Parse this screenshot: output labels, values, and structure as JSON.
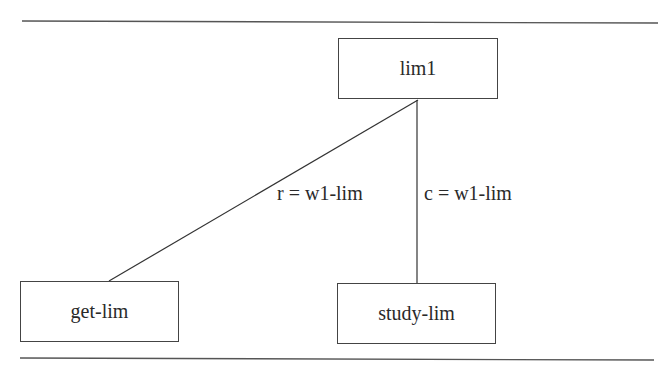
{
  "diagram": {
    "type": "tree",
    "nodes": [
      {
        "id": "lim1",
        "label": "lim1"
      },
      {
        "id": "get-lim",
        "label": "get-lim"
      },
      {
        "id": "study-lim",
        "label": "study-lim"
      }
    ],
    "edges": [
      {
        "from": "lim1",
        "to": "get-lim",
        "label": "r = w1-lim"
      },
      {
        "from": "lim1",
        "to": "study-lim",
        "label": "c = w1-lim"
      }
    ],
    "colors": {
      "stroke": "#444444",
      "text": "#2a2a2a",
      "background": "#ffffff"
    }
  }
}
